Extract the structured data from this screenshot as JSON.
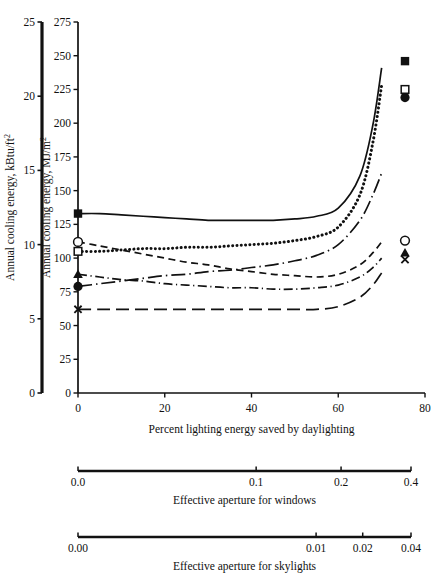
{
  "chart_data": {
    "type": "line",
    "title": "",
    "xlabel": "Percent lighting energy saved by daylighting",
    "ylabel_left": "Annual cooling energy, kBtu/ft2",
    "ylabel_right": "Annual cooling energy, MJ/m2",
    "ylabel_left_base": "Annual cooling energy, kBtu/ft",
    "ylabel_left_sup": "2",
    "ylabel_right_base": "Annual cooling energy, MJ/m",
    "ylabel_right_sup": "2",
    "xlim": [
      0,
      80
    ],
    "ylim_left": [
      0,
      25
    ],
    "ylim_right": [
      0,
      275
    ],
    "xticks": [
      "0",
      "20",
      "40",
      "60",
      "80"
    ],
    "xtick_values": [
      0,
      20,
      40,
      60,
      80
    ],
    "yticks_left": [
      "0",
      "5",
      "10",
      "15",
      "20",
      "25"
    ],
    "ytick_left_values": [
      0,
      5,
      10,
      15,
      20,
      25
    ],
    "yticks_right": [
      "0",
      "25",
      "50",
      "75",
      "100",
      "125",
      "150",
      "175",
      "200",
      "225",
      "250",
      "275"
    ],
    "ytick_right_values": [
      0,
      25,
      50,
      75,
      100,
      125,
      150,
      175,
      200,
      225,
      250,
      275
    ],
    "grid": false,
    "legend": "none",
    "series": [
      {
        "name": "series-solid",
        "style": "solid",
        "marker": "filled-square",
        "marker_start_value": 133,
        "marker_end_value": 246,
        "x": [
          0,
          5,
          10,
          15,
          20,
          25,
          30,
          35,
          40,
          45,
          50,
          55,
          60,
          65,
          68,
          70
        ],
        "y": [
          133,
          133,
          132,
          131,
          130,
          129,
          128,
          128,
          128,
          128,
          129,
          131,
          137,
          161,
          199,
          241
        ]
      },
      {
        "name": "series-dotted",
        "style": "dotted",
        "marker": "open-square",
        "marker_start_value": 105,
        "marker_end_value": 225,
        "x": [
          0,
          5,
          10,
          15,
          20,
          25,
          30,
          35,
          40,
          45,
          50,
          55,
          60,
          65,
          68,
          70
        ],
        "y": [
          105,
          105,
          106,
          107,
          107,
          108,
          108,
          109,
          110,
          111,
          113,
          116,
          123,
          147,
          186,
          228
        ]
      },
      {
        "name": "series-dashed-descending",
        "style": "dashed",
        "marker": "open-circle",
        "marker_start_value": 112,
        "marker_end_value": 113,
        "x": [
          0,
          5,
          10,
          15,
          20,
          25,
          30,
          35,
          40,
          45,
          50,
          55,
          60,
          65,
          68,
          70
        ],
        "y": [
          112,
          109,
          106,
          103,
          100,
          97,
          95,
          92,
          90,
          88,
          87,
          86,
          88,
          95,
          104,
          112
        ]
      },
      {
        "name": "series-longdashdot-rising",
        "style": "longdashdot",
        "marker": "filled-circle",
        "marker_start_value": 79,
        "marker_end_value": 219,
        "x": [
          0,
          5,
          10,
          15,
          20,
          25,
          30,
          35,
          40,
          45,
          50,
          55,
          60,
          65,
          68,
          70
        ],
        "y": [
          79,
          81,
          83,
          85,
          87,
          88,
          90,
          91,
          93,
          95,
          98,
          102,
          110,
          128,
          147,
          163
        ]
      },
      {
        "name": "series-dashdot-flat",
        "style": "dashdot",
        "marker": "filled-triangle",
        "marker_start_value": 88,
        "marker_end_value": 104,
        "x": [
          0,
          5,
          10,
          15,
          20,
          25,
          30,
          35,
          40,
          45,
          50,
          55,
          60,
          65,
          68,
          70
        ],
        "y": [
          88,
          86,
          84,
          83,
          81,
          80,
          79,
          78,
          78,
          77,
          77,
          78,
          80,
          86,
          93,
          100
        ]
      },
      {
        "name": "series-longdash-bottom",
        "style": "longdash",
        "marker": "cross",
        "marker_start_value": 62,
        "marker_end_value": 99,
        "x": [
          0,
          5,
          10,
          15,
          20,
          25,
          30,
          35,
          40,
          45,
          50,
          55,
          60,
          65,
          68,
          70
        ],
        "y": [
          62,
          62,
          62,
          62,
          62,
          62,
          62,
          62,
          62,
          62,
          62,
          62,
          64,
          71,
          80,
          89
        ]
      }
    ],
    "secondary_axes": [
      {
        "name": "windows",
        "label": "Effective aperture for windows",
        "ticks": [
          {
            "label": "0.0",
            "pos": 0.0
          },
          {
            "label": "0.1",
            "pos": 0.535
          },
          {
            "label": "0.2",
            "pos": 0.79
          },
          {
            "label": "0.4",
            "pos": 1.0
          }
        ]
      },
      {
        "name": "skylights",
        "label": "Effective aperture for skylights",
        "ticks": [
          {
            "label": "0.00",
            "pos": 0.0
          },
          {
            "label": "0.01",
            "pos": 0.715
          },
          {
            "label": "0.02",
            "pos": 0.855
          },
          {
            "label": "0.04",
            "pos": 1.0
          }
        ]
      }
    ]
  },
  "colors": {
    "ink": "#111111",
    "background": "#ffffff"
  }
}
